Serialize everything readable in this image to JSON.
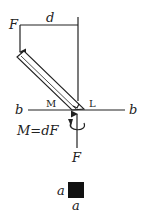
{
  "diagram": {
    "labels": {
      "force_top": "F",
      "distance": "d",
      "axis_left": "b",
      "axis_right": "b",
      "point_m": "M",
      "point_l": "L",
      "moment_eq": "M=dF",
      "force_bottom": "F",
      "square_side_left": "a",
      "square_side_bottom": "a"
    },
    "colors": {
      "ink": "#222222",
      "square_fill": "#111111"
    }
  }
}
